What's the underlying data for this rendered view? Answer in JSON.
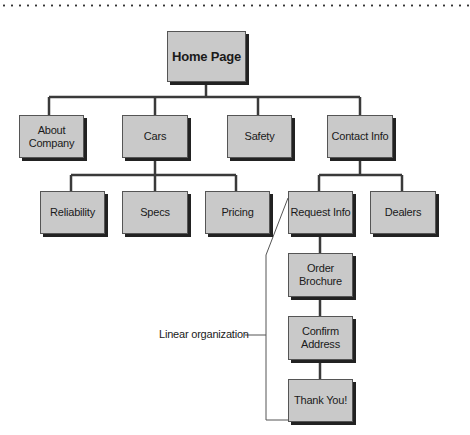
{
  "diagram": {
    "root": {
      "label": "Home Page"
    },
    "level1": [
      {
        "label": "About Company"
      },
      {
        "label": "Cars"
      },
      {
        "label": "Safety"
      },
      {
        "label": "Contact Info"
      }
    ],
    "cars_children": [
      {
        "label": "Reliability"
      },
      {
        "label": "Specs"
      },
      {
        "label": "Pricing"
      }
    ],
    "contact_children": [
      {
        "label": "Request Info"
      },
      {
        "label": "Dealers"
      }
    ],
    "linear_sequence": [
      {
        "label": "Order Brochure"
      },
      {
        "label": "Confirm Address"
      },
      {
        "label": "Thank You!"
      }
    ],
    "annotation": {
      "label": "Linear organization"
    }
  }
}
